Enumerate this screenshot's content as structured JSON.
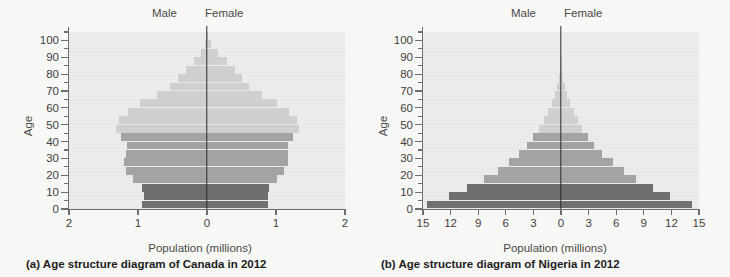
{
  "figure": {
    "gender_left": "Male",
    "gender_right": "Female",
    "axis_title_x": "Population (millions)",
    "axis_title_y": "Age",
    "colors": {
      "plot_background": "#e9e9e7",
      "page_background": "#f7f7f5",
      "bar_dark": "#6f6f6f",
      "bar_mid": "#a3a3a3",
      "bar_light": "#cfcfcf",
      "axis": "#6e6e6e",
      "midline": "#2b2b2b"
    }
  },
  "panels": [
    {
      "caption": "(a) Age structure diagram of Canada in 2012",
      "caption_tag": "(a)",
      "chart_data": {
        "type": "bar",
        "title": "Age structure diagram of Canada in 2012",
        "subtitle": "",
        "orientation": "horizontal-diverging",
        "xlabel": "Population (millions)",
        "ylabel": "Age",
        "xlim": [
          -2,
          2
        ],
        "ylim": [
          0,
          105
        ],
        "xticks": [
          -2,
          -1,
          0,
          1,
          2
        ],
        "xtick_labels": [
          "2",
          "1",
          "0",
          "1",
          "2"
        ],
        "yticks": [
          0,
          10,
          20,
          30,
          40,
          50,
          60,
          70,
          80,
          90,
          100
        ],
        "ytick_minor_step": 5,
        "grid": false,
        "legend": [
          "Male",
          "Female"
        ],
        "legend_position": "top",
        "categories": [
          "0-4",
          "5-9",
          "10-14",
          "15-19",
          "20-24",
          "25-29",
          "30-34",
          "35-39",
          "40-44",
          "45-49",
          "50-54",
          "55-59",
          "60-64",
          "65-69",
          "70-74",
          "75-79",
          "80-84",
          "85-89",
          "90-94",
          "95-99",
          "100+"
        ],
        "series": [
          {
            "name": "Male",
            "values": [
              0.94,
              0.92,
              0.94,
              1.07,
              1.17,
              1.2,
              1.18,
              1.16,
              1.24,
              1.32,
              1.28,
              1.15,
              0.97,
              0.73,
              0.54,
              0.42,
              0.31,
              0.19,
              0.09,
              0.03,
              0.01
            ]
          },
          {
            "name": "Female",
            "values": [
              0.89,
              0.88,
              0.9,
              1.02,
              1.12,
              1.17,
              1.17,
              1.17,
              1.25,
              1.34,
              1.31,
              1.19,
              1.02,
              0.79,
              0.61,
              0.5,
              0.41,
              0.29,
              0.16,
              0.06,
              0.02
            ]
          }
        ],
        "color_bands": [
          {
            "name": "pre-reproductive",
            "ages": "0-14",
            "color": "#6f6f6f"
          },
          {
            "name": "reproductive",
            "ages": "15-44",
            "color": "#a3a3a3"
          },
          {
            "name": "post-reproductive",
            "ages": "45+",
            "color": "#cfcfcf"
          }
        ]
      }
    },
    {
      "caption": "(b) Age structure diagram of Nigeria in 2012",
      "caption_tag": "(b)",
      "chart_data": {
        "type": "bar",
        "title": "Age structure diagram of Nigeria in 2012",
        "subtitle": "",
        "orientation": "horizontal-diverging",
        "xlabel": "Population (millions)",
        "ylabel": "Age",
        "xlim": [
          -15,
          15
        ],
        "ylim": [
          0,
          105
        ],
        "xticks": [
          -15,
          -12,
          -9,
          -6,
          -3,
          0,
          3,
          6,
          9,
          12,
          15
        ],
        "xtick_labels": [
          "15",
          "12",
          "9",
          "6",
          "3",
          "0",
          "3",
          "6",
          "9",
          "12",
          "15"
        ],
        "yticks": [
          0,
          10,
          20,
          30,
          40,
          50,
          60,
          70,
          80,
          90,
          100
        ],
        "ytick_minor_step": 5,
        "grid": false,
        "legend": [
          "Male",
          "Female"
        ],
        "legend_position": "top",
        "categories": [
          "0-4",
          "5-9",
          "10-14",
          "15-19",
          "20-24",
          "25-29",
          "30-34",
          "35-39",
          "40-44",
          "45-49",
          "50-54",
          "55-59",
          "60-64",
          "65-69",
          "70-74",
          "75-79",
          "80-84",
          "85-89",
          "90-94",
          "95-99",
          "100+"
        ],
        "series": [
          {
            "name": "Male",
            "values": [
              14.6,
              12.2,
              10.2,
              8.4,
              6.9,
              5.7,
              4.6,
              3.7,
              3.0,
              2.4,
              1.9,
              1.4,
              1.0,
              0.7,
              0.45,
              0.25,
              0.12,
              0.05,
              0.02,
              0.01,
              0.0
            ]
          },
          {
            "name": "Female",
            "values": [
              14.2,
              11.9,
              10.0,
              8.2,
              6.8,
              5.6,
              4.5,
              3.6,
              2.9,
              2.3,
              1.8,
              1.4,
              1.0,
              0.7,
              0.45,
              0.25,
              0.12,
              0.05,
              0.02,
              0.01,
              0.0
            ]
          }
        ],
        "color_bands": [
          {
            "name": "pre-reproductive",
            "ages": "0-14",
            "color": "#6f6f6f"
          },
          {
            "name": "reproductive",
            "ages": "15-44",
            "color": "#a3a3a3"
          },
          {
            "name": "post-reproductive",
            "ages": "45+",
            "color": "#cfcfcf"
          }
        ]
      }
    }
  ]
}
